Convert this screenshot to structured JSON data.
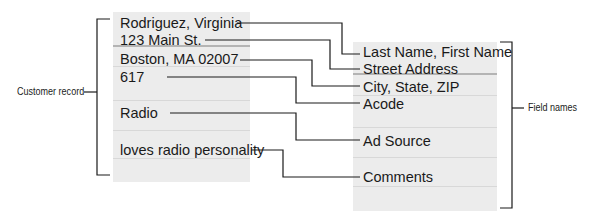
{
  "diagram": {
    "left_label": "Customer record",
    "right_label": "Field names",
    "record_values": [
      "Rodriguez, Virginia",
      "123 Main St.",
      "Boston, MA 02007",
      "617",
      "Radio",
      "loves radio personality"
    ],
    "field_names": [
      "Last Name, First Name",
      "Street Address",
      "City, State, ZIP",
      "Acode",
      "Ad Source",
      "Comments"
    ],
    "colors": {
      "card_background": "#ececec",
      "line": "#1a1a1a",
      "text": "#1a1a1a"
    }
  }
}
